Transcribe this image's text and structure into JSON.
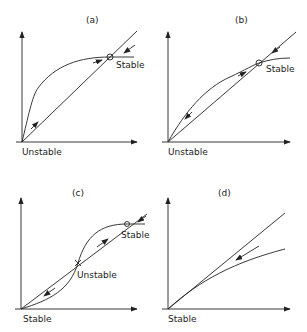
{
  "panels": [
    {
      "id": "a",
      "title": "(a)",
      "labels": {
        "origin": "Unstable",
        "intersection": "Stable"
      }
    },
    {
      "id": "b",
      "title": "(b)",
      "labels": {
        "origin": "Unstable",
        "intersection": "Stable"
      }
    },
    {
      "id": "c",
      "title": "(c)",
      "labels": {
        "origin": "Stable",
        "middle": "Unstable",
        "upper": "Stable"
      }
    },
    {
      "id": "d",
      "title": "(d)",
      "labels": {
        "origin": "Stable"
      }
    }
  ],
  "colors": {
    "ink": "#222222",
    "background": "#ffffff"
  }
}
